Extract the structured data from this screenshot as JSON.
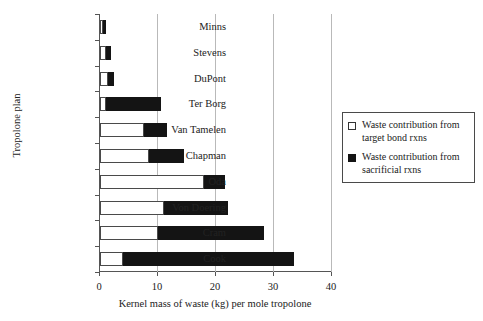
{
  "chart_data": {
    "type": "bar",
    "orientation": "horizontal",
    "title": "",
    "xlabel": "Kernel mass of waste (kg) per mole tropolone",
    "ylabel": "Tropolone plan",
    "xlim": [
      0,
      40
    ],
    "xticks": [
      0,
      10,
      20,
      30,
      40
    ],
    "grid": true,
    "legend_position": "right",
    "categories": [
      "Minns",
      "Stevens",
      "DuPont",
      "Ter Borg",
      "Van Tamelen",
      "Chapman",
      "Oda",
      "Von Doering",
      "Cram",
      "Cook"
    ],
    "series": [
      {
        "name": "Waste contribution from target bond rxns",
        "color": "#ffffff",
        "values": [
          0.2,
          1.1,
          1.4,
          1.0,
          7.6,
          8.5,
          18.0,
          11.1,
          10.0,
          4.0
        ]
      },
      {
        "name": "Waste contribution from sacrificial rxns",
        "color": "#141414",
        "values": [
          0.4,
          0.8,
          1.0,
          9.6,
          4.0,
          6.0,
          3.6,
          10.9,
          18.2,
          29.4
        ]
      }
    ],
    "totals": [
      0.6,
      1.9,
      2.4,
      10.6,
      11.6,
      14.5,
      21.6,
      22.0,
      28.2,
      33.4
    ]
  },
  "legend": {
    "items": [
      {
        "label": "Waste contribution from target bond rxns",
        "swatch": "open-square"
      },
      {
        "label": "Waste contribution from sacrificial rxns",
        "swatch": "filled-square"
      }
    ]
  }
}
